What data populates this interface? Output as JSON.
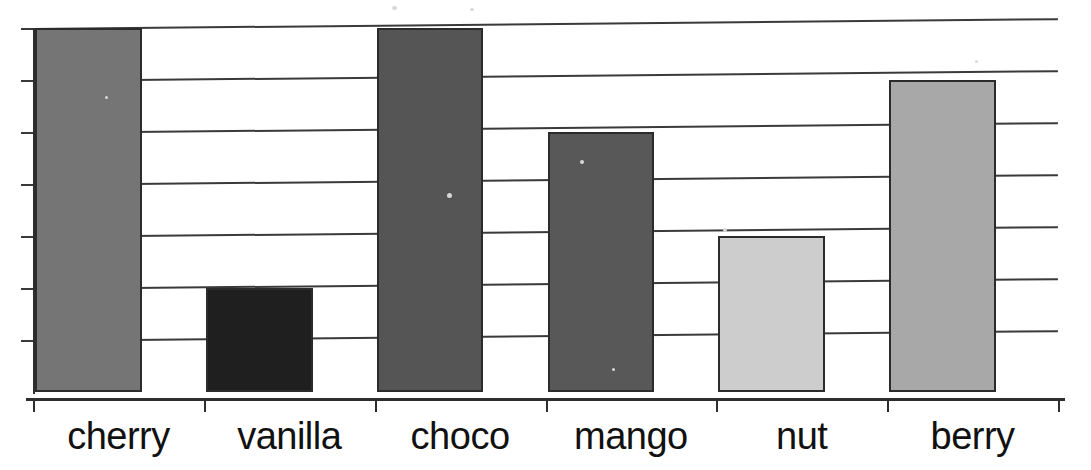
{
  "chart_data": {
    "type": "bar",
    "title": "",
    "subtitle": "",
    "xlabel": "",
    "ylabel": "",
    "categories": [
      "cherry",
      "vanilla",
      "choco",
      "mango",
      "nut",
      "berry"
    ],
    "values": [
      7,
      2,
      7,
      5,
      3,
      6
    ],
    "ylim": [
      0,
      7
    ],
    "y_tick_values": [
      1,
      2,
      3,
      4,
      5,
      6,
      7
    ],
    "grid": true,
    "grid_axis": "y",
    "y_axis_tick_labels_visible": false,
    "legend": false,
    "legend_position": "none",
    "annotations": [],
    "bar_colors": [
      "#757575",
      "#1f1f1f",
      "#555555",
      "#585858",
      "#cdcdcd",
      "#a8a8a8"
    ],
    "bar_edge_color": "#2b2b2b",
    "gridline_color": "#3a3a3a",
    "axis_color": "#2e2e2e",
    "background_color": "#ffffff",
    "bars": [
      {
        "category": "cherry",
        "value": 7,
        "color": "#757575"
      },
      {
        "category": "vanilla",
        "value": 2,
        "color": "#1f1f1f"
      },
      {
        "category": "choco",
        "value": 7,
        "color": "#555555"
      },
      {
        "category": "mango",
        "value": 5,
        "color": "#585858"
      },
      {
        "category": "nut",
        "value": 3,
        "color": "#cdcdcd"
      },
      {
        "category": "berry",
        "value": 6,
        "color": "#a8a8a8"
      }
    ]
  }
}
